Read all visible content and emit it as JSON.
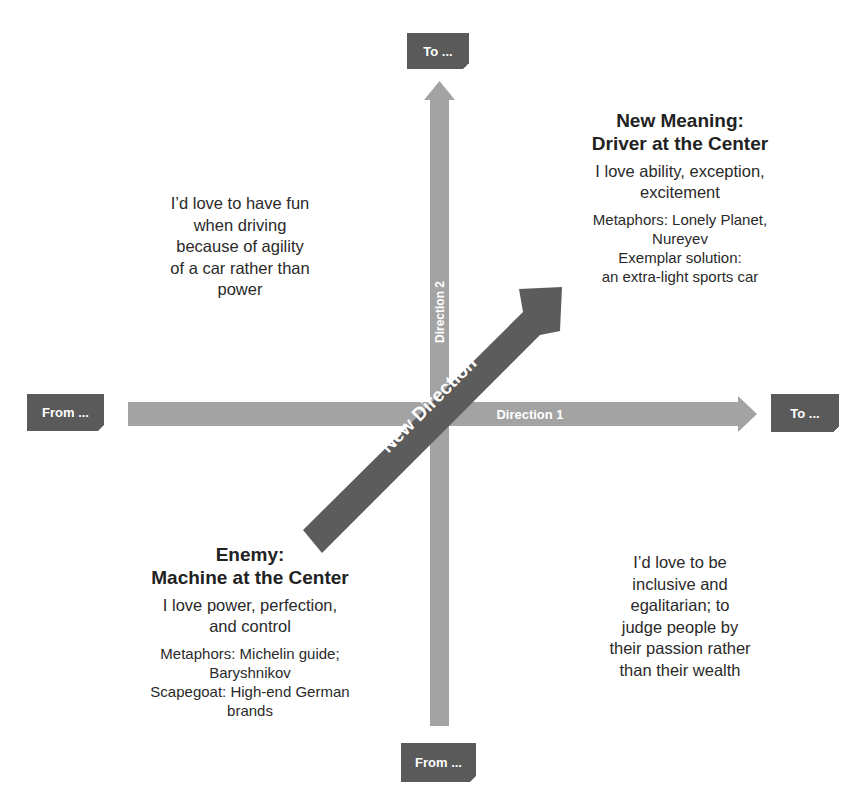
{
  "diagram": {
    "boxes": {
      "top": {
        "label": "To ..."
      },
      "bottom": {
        "label": "From ..."
      },
      "left": {
        "label": "From ..."
      },
      "right": {
        "label": "To ..."
      }
    },
    "axes": {
      "horizontal": {
        "label": "Direction 1"
      },
      "vertical": {
        "label": "Direction 2"
      },
      "diagonal": {
        "label": "New Direction"
      }
    },
    "quadrants": {
      "top_right": {
        "heading_line1": "New Meaning:",
        "heading_line2": "Driver at the Center",
        "sub_line1": "I love ability, exception,",
        "sub_line2": "excitement",
        "meta_line1": "Metaphors: Lonely Planet,",
        "meta_line2": "Nureyev",
        "meta_line3": "Exemplar solution:",
        "meta_line4": "an extra-light sports car"
      },
      "top_left": {
        "line1": "I’d love to have fun",
        "line2": "when driving",
        "line3": "because of agility",
        "line4": "of a car rather than",
        "line5": "power"
      },
      "bottom_left": {
        "heading_line1": "Enemy:",
        "heading_line2": "Machine at the Center",
        "sub_line1": "I love power, perfection,",
        "sub_line2": "and control",
        "meta_line1": "Metaphors: Michelin guide;",
        "meta_line2": "Baryshnikov",
        "meta_line3": "Scapegoat: High-end German",
        "meta_line4": "brands"
      },
      "bottom_right": {
        "line1": "I’d love to be",
        "line2": "inclusive and",
        "line3": "egalitarian; to",
        "line4": "judge people by",
        "line5": "their passion rather",
        "line6": "than their wealth"
      }
    },
    "colors": {
      "box_fill": "#5a5a5a",
      "axis_fill": "#a3a3a3",
      "diagonal_fill": "#5c5c5c",
      "text": "#222222",
      "label_text": "#ffffff"
    }
  }
}
